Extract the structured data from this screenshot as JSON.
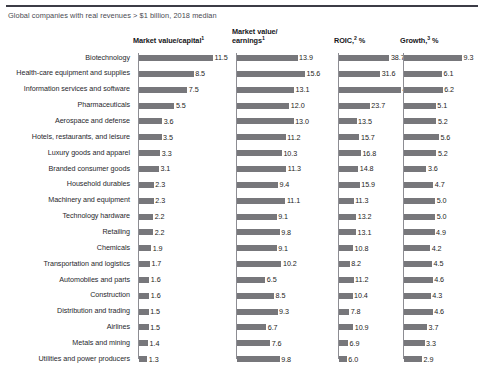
{
  "exhibit": {
    "subtitle": "Global companies with real revenues > $1 billion, 2018 median"
  },
  "columns": [
    {
      "id": "market-value-capital",
      "label": "Market value/capital",
      "note": "1",
      "line2": ""
    },
    {
      "id": "market-value-earnings",
      "label": "Market value/",
      "note": "1",
      "line2": "earnings"
    },
    {
      "id": "roic",
      "label": "ROIC,",
      "note": "2",
      "line2": "",
      "suffix": " %"
    },
    {
      "id": "growth",
      "label": "Growth,",
      "note": "3",
      "line2": "",
      "suffix": " %"
    }
  ],
  "chart_data": {
    "type": "bar",
    "title": "",
    "subtitle": "Global companies with real revenues > $1 billion, 2018 median",
    "orientation": "horizontal",
    "grid": false,
    "legend": null,
    "panels": [
      {
        "name": "Market value/capital",
        "footnote_marker": "1",
        "unit": "ratio",
        "xlim": [
          0,
          11.5
        ],
        "values": [
          11.5,
          8.5,
          7.5,
          5.5,
          3.6,
          3.5,
          3.3,
          3.1,
          2.3,
          2.3,
          2.2,
          2.2,
          1.9,
          1.7,
          1.6,
          1.6,
          1.5,
          1.5,
          1.4,
          1.3
        ]
      },
      {
        "name": "Market value/earnings",
        "footnote_marker": "1",
        "unit": "ratio",
        "xlim": [
          0,
          15.6
        ],
        "values": [
          13.9,
          15.6,
          13.1,
          12.0,
          13.0,
          11.2,
          10.3,
          11.3,
          9.4,
          11.1,
          9.1,
          9.8,
          9.1,
          10.2,
          6.5,
          8.5,
          9.3,
          6.7,
          7.6,
          9.8
        ]
      },
      {
        "name": "ROIC, %",
        "footnote_marker": "2",
        "unit": "%",
        "xlim": [
          0,
          47.6
        ],
        "values": [
          38.7,
          31.6,
          47.6,
          23.7,
          13.5,
          15.7,
          16.8,
          14.8,
          15.9,
          11.3,
          13.2,
          13.1,
          10.8,
          8.2,
          11.2,
          10.4,
          7.8,
          10.9,
          6.9,
          6.0
        ]
      },
      {
        "name": "Growth, %",
        "footnote_marker": "3",
        "unit": "%",
        "xlim": [
          0,
          9.3
        ],
        "values": [
          9.3,
          6.1,
          6.2,
          5.1,
          5.2,
          5.6,
          5.2,
          3.6,
          4.7,
          5.0,
          5.0,
          4.9,
          4.2,
          4.5,
          4.6,
          4.3,
          4.6,
          3.7,
          3.3,
          2.9
        ]
      }
    ],
    "categories": [
      "Biotechnology",
      "Health-care equipment and supplies",
      "Information services and software",
      "Pharmaceuticals",
      "Aerospace and defense",
      "Hotels, restaurants, and leisure",
      "Luxury goods and apparel",
      "Branded consumer goods",
      "Household durables",
      "Machinery and equipment",
      "Technology hardware",
      "Retailing",
      "Chemicals",
      "Transportation and logistics",
      "Automobiles and parts",
      "Construction",
      "Distribution and trading",
      "Airlines",
      "Metals and mining",
      "Utilities and power producers"
    ]
  },
  "style": {
    "bar_color": "#77777b",
    "rule_color": "#3c3c46",
    "axis_color": "#8d8d93",
    "text_color": "#1d1d22"
  }
}
